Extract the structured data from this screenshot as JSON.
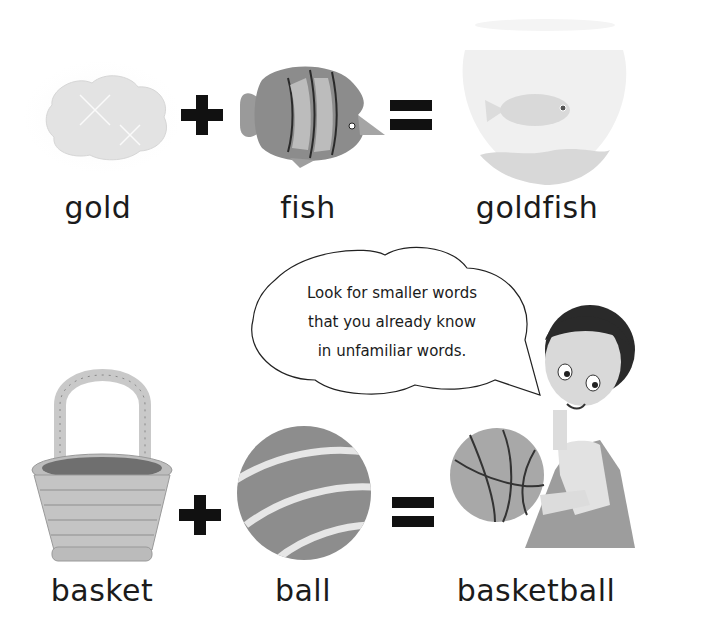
{
  "equations": [
    {
      "parts": [
        {
          "word": "gold",
          "image": "gold-nugget-image"
        },
        {
          "operator": "+"
        },
        {
          "word": "fish",
          "image": "striped-fish-image"
        },
        {
          "operator": "="
        },
        {
          "word": "goldfish",
          "image": "goldfish-bowl-image"
        }
      ]
    },
    {
      "parts": [
        {
          "word": "basket",
          "image": "basket-image"
        },
        {
          "operator": "+"
        },
        {
          "word": "ball",
          "image": "striped-ball-image"
        },
        {
          "operator": "="
        },
        {
          "word": "basketball",
          "image": "boy-holding-basketball-image"
        }
      ]
    }
  ],
  "speech_bubble": {
    "lines": [
      "Look for smaller words",
      "that you already know",
      "in unfamiliar words."
    ]
  }
}
